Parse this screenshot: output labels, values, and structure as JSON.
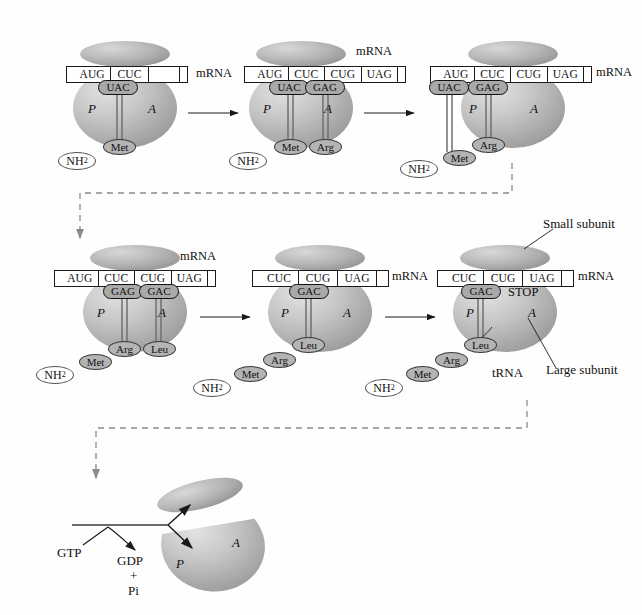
{
  "diagram": {
    "mrna_label": "mRNA",
    "site_p": "P",
    "site_a": "A",
    "stop_label": "STOP",
    "amine_terminus": "NH",
    "amine_subscript": "2",
    "annotations": {
      "small_subunit": "Small subunit",
      "large_subunit": "Large subunit",
      "trna": "tRNA"
    },
    "energy": {
      "gtp": "GTP",
      "gdp": "GDP",
      "plus": "+",
      "pi": "Pi"
    },
    "colors": {
      "ribosome_large": "#b9b9b9",
      "ribosome_small": "#a8a8a8",
      "anticodon_fill": "#a9a9a9",
      "amino_fill": "#b4b4b4",
      "outline": "#1a1a1a",
      "dashed_arrow": "#8a8a8a",
      "background": "#fefefe"
    },
    "panels": [
      {
        "id": "panel-1",
        "stage": "initiation",
        "codons": [
          "AUG",
          "CUC",
          ""
        ],
        "anticodons": [
          {
            "seq": "UAC",
            "site": "P"
          }
        ],
        "amino_acids": [
          "Met"
        ],
        "site_p": "P",
        "site_a": "A",
        "mrna_label": "mRNA"
      },
      {
        "id": "panel-2",
        "stage": "elongation-binding",
        "codons": [
          "AUG",
          "CUC",
          "CUG",
          "UAG"
        ],
        "anticodons": [
          {
            "seq": "UAC",
            "site": "P"
          },
          {
            "seq": "GAG",
            "site": "A"
          }
        ],
        "amino_acids": [
          "Met",
          "Arg"
        ],
        "site_p": "P",
        "site_a": "A",
        "mrna_label": "mRNA"
      },
      {
        "id": "panel-3",
        "stage": "translocation",
        "codons": [
          "AUG",
          "CUC",
          "CUG",
          "UAG"
        ],
        "anticodons": [
          {
            "seq": "UAC",
            "site": "exit"
          },
          {
            "seq": "GAG",
            "site": "P"
          }
        ],
        "amino_acids": [
          "Met",
          "Arg"
        ],
        "site_p": "P",
        "site_a": "A",
        "mrna_label": "mRNA"
      },
      {
        "id": "panel-4",
        "stage": "elongation-binding",
        "codons": [
          "AUG",
          "CUC",
          "CUG",
          "UAG"
        ],
        "anticodons": [
          {
            "seq": "GAG",
            "site": "P"
          },
          {
            "seq": "GAC",
            "site": "A"
          }
        ],
        "amino_acids": [
          "Met",
          "Arg",
          "Leu"
        ],
        "site_p": "P",
        "site_a": "A",
        "mrna_label": "mRNA"
      },
      {
        "id": "panel-5",
        "stage": "translocation",
        "codons": [
          "CUC",
          "CUG",
          "UAG"
        ],
        "anticodons": [
          {
            "seq": "GAC",
            "site": "P"
          }
        ],
        "amino_acids": [
          "Met",
          "Arg",
          "Leu"
        ],
        "site_p": "P",
        "site_a": "A",
        "mrna_label": "mRNA"
      },
      {
        "id": "panel-6",
        "stage": "termination",
        "codons": [
          "CUC",
          "CUG",
          "UAG"
        ],
        "anticodons": [
          {
            "seq": "GAC",
            "site": "P"
          }
        ],
        "amino_acids": [
          "Met",
          "Arg",
          "Leu"
        ],
        "site_p": "P",
        "site_a": "A",
        "stop_label": "STOP",
        "mrna_label": "mRNA"
      },
      {
        "id": "panel-7",
        "stage": "dissociation",
        "site_p": "P",
        "site_a": "A",
        "energy_in": "GTP",
        "energy_out": [
          "GDP",
          "+",
          "Pi"
        ]
      }
    ]
  }
}
